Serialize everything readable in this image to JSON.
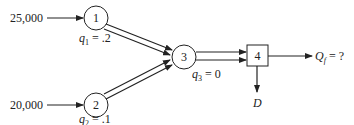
{
  "diagram": {
    "inputs": [
      {
        "id": "in1",
        "value": "25,000",
        "target": "1"
      },
      {
        "id": "in2",
        "value": "20,000",
        "target": "2"
      }
    ],
    "nodes": [
      {
        "id": "1",
        "shape": "circle",
        "label": "1",
        "param": "q",
        "sub": "1",
        "param_value": " = .2"
      },
      {
        "id": "2",
        "shape": "circle",
        "label": "2",
        "param": "q",
        "sub": "2",
        "param_value": " = .1"
      },
      {
        "id": "3",
        "shape": "circle",
        "label": "3",
        "param": "q",
        "sub": "3",
        "param_value": " = 0"
      },
      {
        "id": "4",
        "shape": "square",
        "label": "4"
      }
    ],
    "outputs": {
      "flow": {
        "symbol": "Q",
        "sub": "f",
        "value": " = ?"
      },
      "drain": {
        "symbol": "D"
      }
    },
    "colors": {
      "stroke": "#222222",
      "background": "#ffffff"
    }
  }
}
